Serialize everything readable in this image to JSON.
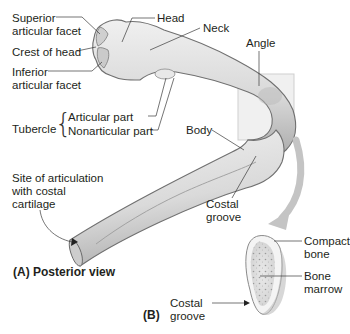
{
  "figure": {
    "panel_a": {
      "title": "(A) Posterior view",
      "labels": {
        "superior_articular_facet": [
          "Superior",
          "articular facet"
        ],
        "crest_of_head": "Crest of head",
        "inferior_articular_facet": [
          "Inferior",
          "articular facet"
        ],
        "head": "Head",
        "neck": "Neck",
        "angle": "Angle",
        "tubercle": "Tubercle",
        "tubercle_articular_part": "Articular part",
        "tubercle_nonarticular_part": "Nonarticular part",
        "body": "Body",
        "costal_groove": [
          "Costal",
          "groove"
        ],
        "site_of_articulation": [
          "Site of articulation",
          "with costal",
          "cartilage"
        ]
      }
    },
    "panel_b": {
      "title": "(B)",
      "labels": {
        "compact_bone": [
          "Compact",
          "bone"
        ],
        "bone_marrow": [
          "Bone",
          "marrow"
        ],
        "costal_groove": [
          "Costal",
          "groove"
        ]
      }
    },
    "colors": {
      "bone_fill": "#dcdcdc",
      "bone_shadow": "#a9a9a9",
      "bone_outline": "#6e6e6e",
      "highlight_box": "#e6e6e6",
      "arrow": "#bdbdbd",
      "leader_line": "#3a3a3a",
      "text": "#231f20"
    }
  }
}
